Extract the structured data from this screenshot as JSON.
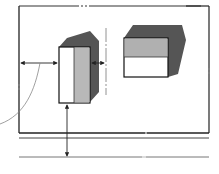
{
  "diagram": {
    "colors": {
      "line": "#222222",
      "dark_shade": "#555555",
      "mid_shade": "#b8b8b8",
      "light_face": "#ffffff",
      "dash": "#888888"
    },
    "objects": [
      {
        "id": "tall-block",
        "type": "3d-box",
        "faces": [
          "white-front",
          "gray-side",
          "dark-shadow"
        ]
      },
      {
        "id": "wide-block",
        "type": "3d-box",
        "faces": [
          "gray-top-half",
          "white-bottom-half",
          "dark-shadow"
        ]
      }
    ],
    "annotations": [
      {
        "id": "horizontal-dimension-left",
        "type": "double-arrow"
      },
      {
        "id": "horizontal-dimension-right",
        "type": "double-arrow"
      },
      {
        "id": "vertical-dimension-bottom",
        "type": "double-arrow"
      },
      {
        "id": "curved-leader",
        "type": "leader-line"
      }
    ]
  }
}
